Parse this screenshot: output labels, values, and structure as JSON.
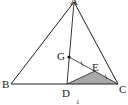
{
  "figure": {
    "caption": "1",
    "colors": {
      "line": "#222222",
      "shade": "#a9a9a9"
    },
    "points": {
      "A": {
        "label": "A"
      },
      "B": {
        "label": "B"
      },
      "C": {
        "label": "C"
      },
      "D": {
        "label": "D"
      },
      "E": {
        "label": "E"
      },
      "G": {
        "label": "G"
      }
    },
    "segments": [
      "AB",
      "AC",
      "BC",
      "AD",
      "GC",
      "DE"
    ],
    "shaded_region": "triangle DEC",
    "equal_marks": [
      "GE",
      "EC"
    ],
    "marked_point": "G"
  }
}
